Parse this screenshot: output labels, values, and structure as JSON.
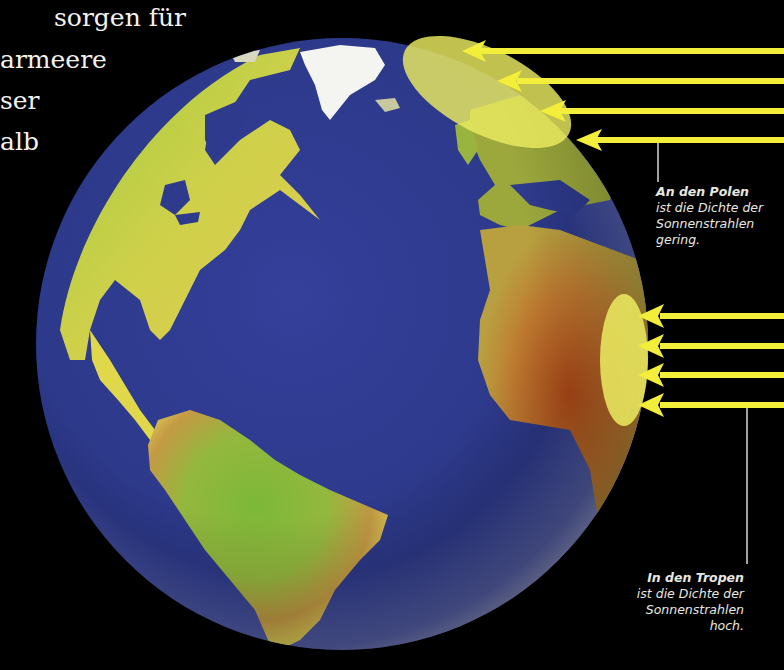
{
  "intro_text": {
    "lines": [
      "sorgen für",
      "armeere",
      "ser",
      "alb"
    ]
  },
  "diagram": {
    "colors": {
      "background": "#000000",
      "ocean": "#2e3a8c",
      "land_green": "#8cc63a",
      "land_yellow": "#e0d84a",
      "desert": "#b85a1e",
      "ice": "#f4f4f0",
      "ray": "#f2ee3a",
      "highlight_area": "#ecec60"
    },
    "rays_top_count": 4,
    "rays_bottom_count": 4
  },
  "captions": {
    "poles": {
      "title": "An den Polen",
      "lines": [
        "ist die Dichte der",
        "Sonnenstrahlen",
        "gering."
      ]
    },
    "tropics": {
      "title": "In den Tropen",
      "lines": [
        "ist die Dichte der",
        "Sonnenstrahlen",
        "hoch."
      ]
    }
  }
}
